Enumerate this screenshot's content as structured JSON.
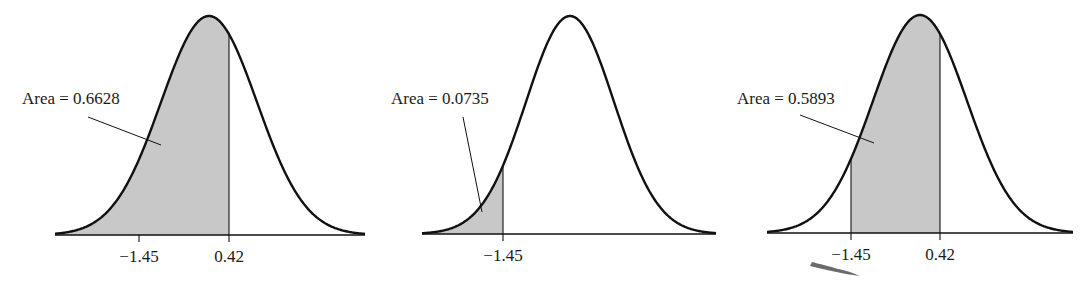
{
  "chart_data": [
    {
      "type": "area",
      "title": "",
      "description": "Standard normal curve, shaded area to the left of 0.42",
      "shade_from": null,
      "shade_to": 0.42,
      "area_label": "Area = 0.6628",
      "area_value": 0.6628,
      "tick_labels": [
        "−1.45",
        "0.42"
      ],
      "tick_values": [
        -1.45,
        0.42
      ],
      "xlabel": "",
      "ylabel": "",
      "grid": false
    },
    {
      "type": "area",
      "title": "",
      "description": "Standard normal curve, shaded area to the left of -1.45",
      "shade_from": null,
      "shade_to": -1.45,
      "area_label": "Area = 0.0735",
      "area_value": 0.0735,
      "tick_labels": [
        "−1.45"
      ],
      "tick_values": [
        -1.45
      ],
      "xlabel": "",
      "ylabel": "",
      "grid": false
    },
    {
      "type": "area",
      "title": "",
      "description": "Standard normal curve, shaded area between -1.45 and 0.42",
      "shade_from": -1.45,
      "shade_to": 0.42,
      "area_label": "Area = 0.5893",
      "area_value": 0.5893,
      "tick_labels": [
        "−1.45",
        "0.42"
      ],
      "tick_values": [
        -1.45,
        0.42
      ],
      "xlabel": "",
      "ylabel": "",
      "grid": false
    }
  ],
  "style": {
    "shade_color": "#c8c8c8",
    "line_color": "#111111"
  },
  "panels": [
    {
      "x0": 55,
      "x1": 365,
      "axis_y": 235,
      "peak_x": 209,
      "peak_y": 16,
      "sigma_px": 48,
      "ticks": [
        {
          "x": 139,
          "label": "−1.45",
          "line": false
        },
        {
          "x": 229,
          "label": "0.42",
          "line": true
        }
      ],
      "shade": [
        null,
        229
      ],
      "label": {
        "text": "Area = 0.6628",
        "x": 22,
        "y": 104
      },
      "leader": [
        [
          88,
          117
        ],
        [
          161,
          145
        ]
      ]
    },
    {
      "x0": 422,
      "x1": 716,
      "axis_y": 234,
      "peak_x": 570,
      "peak_y": 16,
      "sigma_px": 44,
      "ticks": [
        {
          "x": 503,
          "label": "−1.45",
          "line": true
        }
      ],
      "shade": [
        null,
        503
      ],
      "label": {
        "text": "Area = 0.0735",
        "x": 391,
        "y": 104
      },
      "leader": [
        [
          463,
          117
        ],
        [
          482,
          212
        ]
      ]
    },
    {
      "x0": 767,
      "x1": 1073,
      "axis_y": 233,
      "peak_x": 920,
      "peak_y": 15,
      "sigma_px": 47,
      "ticks": [
        {
          "x": 851,
          "label": "−1.45",
          "line": true
        },
        {
          "x": 940,
          "label": "0.42",
          "line": true
        }
      ],
      "shade": [
        851,
        940
      ],
      "label": {
        "text": "Area = 0.5893",
        "x": 737,
        "y": 104
      },
      "leader": [
        [
          800,
          115
        ],
        [
          874,
          143
        ]
      ]
    }
  ]
}
